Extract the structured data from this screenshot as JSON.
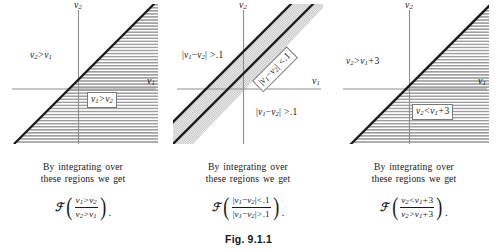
{
  "figure": {
    "caption": "Fig. 9.1.1",
    "common_text_line1": "By integrating over",
    "common_text_line2": "these regions we get",
    "axis_x_label": "v1",
    "axis_y_label": "v2",
    "frak_symbol": "ℱ",
    "period": "."
  },
  "panels": [
    {
      "id": "panel-left",
      "axis_x": "v₁",
      "axis_y": "v₂",
      "region_labels": [
        {
          "name": "upper-region-label",
          "text": "v₂ > v₁",
          "boxed": false
        },
        {
          "name": "lower-region-label",
          "text": "v₁ > v₂",
          "boxed": true
        }
      ],
      "caption_line1": "By integrating over",
      "caption_line2": "these regions we get",
      "formula_numerator": "v₁ > v₂",
      "formula_denominator": "v₂ > v₁"
    },
    {
      "id": "panel-middle",
      "axis_x": "v₁",
      "axis_y": "v₂",
      "region_labels": [
        {
          "name": "upper-left-region-label",
          "text": "|v₁ − v₂| > .1",
          "boxed": false
        },
        {
          "name": "band-region-label",
          "text": "|v₁ − v₂| < .1",
          "boxed": true
        },
        {
          "name": "lower-right-region-label",
          "text": "|v₁ − v₂| > .1",
          "boxed": false
        }
      ],
      "caption_line1": "By integrating over",
      "caption_line2": "these regions we get",
      "formula_numerator": "|v₁ − v₂| < .1",
      "formula_denominator": "|v₁ − v₂| > .1"
    },
    {
      "id": "panel-right",
      "axis_x": "v₁",
      "axis_y": "v₂",
      "region_labels": [
        {
          "name": "upper-left-region-label",
          "text": "v₂ > v₁ + 3",
          "boxed": false
        },
        {
          "name": "lower-right-region-label",
          "text": "v₂ < v₁ + 3",
          "boxed": true
        }
      ],
      "caption_line1": "By integrating over",
      "caption_line2": "these regions we get",
      "formula_numerator": "v₂ < v₁ + 3",
      "formula_denominator": "v₂ > v₁ + 3"
    }
  ],
  "colors": {
    "ink": "#17171a",
    "boundary_line": "#1b1b1e",
    "axis_line": "#8c8c8c",
    "hatch": "#9a9a9a",
    "stipple": "#b9b9b9",
    "page_background": "#ffffff"
  }
}
